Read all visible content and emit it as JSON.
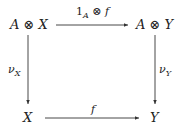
{
  "diagram": {
    "type": "commutative-square",
    "nodes": {
      "top_left": "A ⊗ X",
      "top_right": "A ⊗ Y",
      "bottom_left": "X",
      "bottom_right": "Y"
    },
    "arrows": {
      "top": {
        "label_main": "1",
        "label_sub": "A",
        "label_rest": " ⊗ f",
        "from": "A ⊗ X",
        "to": "A ⊗ Y"
      },
      "left": {
        "label_main": "ν",
        "label_sub": "X",
        "from": "A ⊗ X",
        "to": "X"
      },
      "right": {
        "label_main": "ν",
        "label_sub": "Y",
        "from": "A ⊗ Y",
        "to": "Y"
      },
      "bottom": {
        "label_main": "f",
        "from": "X",
        "to": "Y"
      }
    }
  }
}
